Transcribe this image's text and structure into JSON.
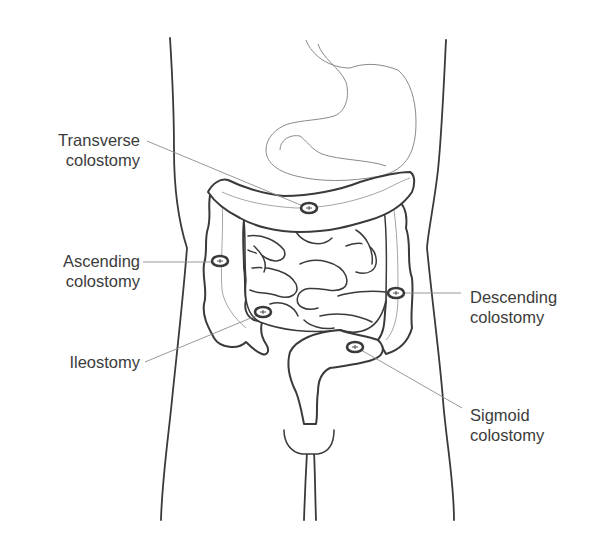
{
  "figure": {
    "colors": {
      "outline": "#3a3a3a",
      "thin_outline": "#8a8a8a",
      "label_text": "#3c3c3c",
      "background": "#ffffff"
    }
  },
  "labels": {
    "transverse": {
      "line1": "Transverse",
      "line2": "colostomy"
    },
    "ascending": {
      "line1": "Ascending",
      "line2": "colostomy"
    },
    "ileostomy": {
      "line1": "Ileostomy"
    },
    "descending": {
      "line1": "Descending",
      "line2": "colostomy"
    },
    "sigmoid": {
      "line1": "Sigmoid",
      "line2": "colostomy"
    }
  },
  "stoma_markers": [
    {
      "name": "transverse-colostomy",
      "x": 309,
      "y": 208
    },
    {
      "name": "ascending-colostomy",
      "x": 220,
      "y": 261
    },
    {
      "name": "ileostomy",
      "x": 263,
      "y": 312
    },
    {
      "name": "descending-colostomy",
      "x": 396,
      "y": 293
    },
    {
      "name": "sigmoid-colostomy",
      "x": 355,
      "y": 347
    }
  ]
}
